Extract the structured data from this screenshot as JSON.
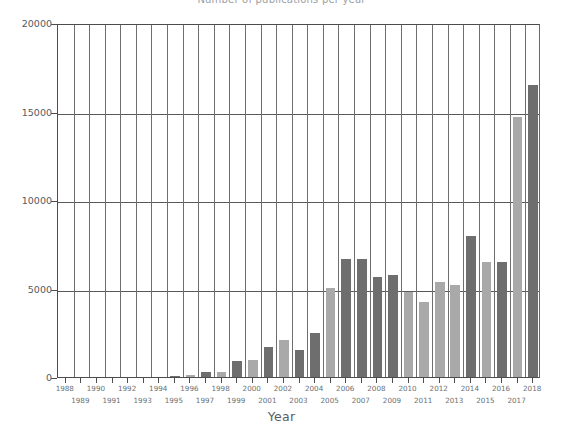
{
  "figure": {
    "title_clipped": "Number of publications per year",
    "background": "#ffffff"
  },
  "axes": {
    "x_title": "Year",
    "y_title": "",
    "y_ticks": [
      "0",
      "5000",
      "10000",
      "15000",
      "20000"
    ],
    "y_tick_values": [
      0,
      5000,
      10000,
      15000,
      20000
    ],
    "ylim": [
      0,
      20000
    ],
    "grid": "horizontal-and-vertical"
  },
  "colors": {
    "bar_light": "#a9a9a9",
    "bar_dark": "#6e6e6e",
    "axis": "#4d4d4d",
    "grid": "#6e6e6e",
    "tick_text": "#6b7074",
    "axis_text": "#585d61"
  },
  "chart_data": {
    "type": "bar",
    "title": "Number of publications per year",
    "xlabel": "Year",
    "ylabel": "",
    "ylim": [
      0,
      20000
    ],
    "grid": true,
    "legend": "none",
    "categories": [
      "1988",
      "1989",
      "1990",
      "1991",
      "1992",
      "1993",
      "1994",
      "1995",
      "1996",
      "1997",
      "1998",
      "1999",
      "2000",
      "2001",
      "2002",
      "2003",
      "2004",
      "2005",
      "2006",
      "2007",
      "2008",
      "2009",
      "2010",
      "2011",
      "2012",
      "2013",
      "2014",
      "2015",
      "2016",
      "2017",
      "2018"
    ],
    "values": [
      0,
      0,
      0,
      0,
      0,
      0,
      0,
      20,
      110,
      300,
      300,
      900,
      950,
      1700,
      2100,
      1550,
      2500,
      5050,
      6650,
      6650,
      5650,
      5750,
      4800,
      4250,
      5350,
      5200,
      7950,
      6500,
      6500,
      14700,
      16500
    ],
    "bar_colors": [
      "#a9a9a9",
      "#6e6e6e",
      "#a9a9a9",
      "#6e6e6e",
      "#a9a9a9",
      "#6e6e6e",
      "#a9a9a9",
      "#6e6e6e",
      "#a9a9a9",
      "#6e6e6e",
      "#a9a9a9",
      "#6e6e6e",
      "#a9a9a9",
      "#6e6e6e",
      "#a9a9a9",
      "#6e6e6e",
      "#6e6e6e",
      "#a9a9a9",
      "#6e6e6e",
      "#6e6e6e",
      "#6e6e6e",
      "#6e6e6e",
      "#a9a9a9",
      "#a9a9a9",
      "#a9a9a9",
      "#a9a9a9",
      "#6e6e6e",
      "#a9a9a9",
      "#6e6e6e",
      "#a9a9a9",
      "#6e6e6e"
    ],
    "x_tick_rows": {
      "row_a": [
        "1988",
        "1990",
        "1992",
        "1994",
        "1996",
        "1998",
        "2000",
        "2002",
        "2004",
        "2006",
        "2008",
        "2010",
        "2012",
        "2014",
        "2016",
        "2018"
      ],
      "row_b": [
        "1989",
        "1991",
        "1993",
        "1995",
        "1997",
        "1999",
        "2001",
        "2003",
        "2005",
        "2007",
        "2009",
        "2011",
        "2013",
        "2015",
        "2017"
      ]
    }
  }
}
